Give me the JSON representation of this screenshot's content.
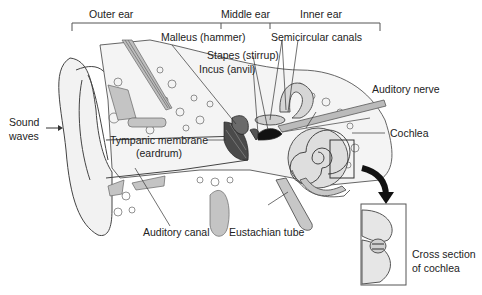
{
  "diagram": {
    "regions": [
      {
        "label": "Outer ear"
      },
      {
        "label": "Middle ear"
      },
      {
        "label": "Inner ear"
      }
    ],
    "labels": {
      "sound_waves_line1": "Sound",
      "sound_waves_line2": "waves",
      "malleus": "Malleus (hammer)",
      "stapes": "Stapes (stirrup)",
      "incus": "Incus (anvil)",
      "semicircular_canals": "Semicircular canals",
      "auditory_nerve": "Auditory nerve",
      "cochlea": "Cochlea",
      "tympanic_line1": "Tympanic membrane",
      "tympanic_line2": "(eardrum)",
      "auditory_canal": "Auditory canal",
      "eustachian_tube": "Eustachian tube",
      "cross_section_line1": "Cross section",
      "cross_section_line2": "of cochlea"
    },
    "colors": {
      "line": "#333333",
      "fill_light": "#e2e2e2",
      "fill_mid": "#bdbdbd",
      "fill_dark": "#3a3a3a",
      "background": "#ffffff"
    }
  }
}
